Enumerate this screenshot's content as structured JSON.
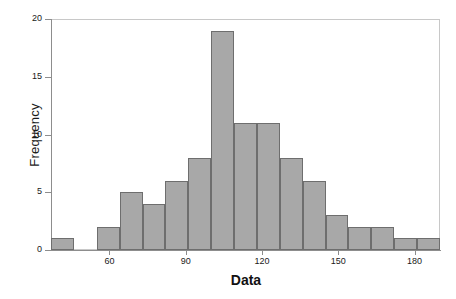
{
  "chart_data": {
    "type": "bar",
    "title": "",
    "xlabel": "Data",
    "ylabel": "Frequency",
    "xlim": [
      37,
      190
    ],
    "ylim": [
      0,
      20
    ],
    "grid": false,
    "legend": null,
    "bin_width": 9,
    "x_ticks": [
      60,
      90,
      120,
      150,
      180
    ],
    "y_ticks": [
      0,
      5,
      10,
      15,
      20
    ],
    "bar_color": "#a8a8a8",
    "bar_edge_color": "#6e6e6e",
    "categories": [
      "37-46",
      "46-55",
      "55-64",
      "64-73",
      "73-82",
      "82-91",
      "91-100",
      "100-109",
      "109-118",
      "118-127",
      "127-136",
      "136-145",
      "145-154",
      "154-163",
      "163-172",
      "172-181",
      "181-190"
    ],
    "bin_starts": [
      37,
      46,
      55,
      64,
      73,
      82,
      91,
      100,
      109,
      118,
      127,
      136,
      145,
      154,
      163,
      172,
      181
    ],
    "values": [
      1,
      0,
      2,
      5,
      4,
      6,
      8,
      19,
      11,
      11,
      8,
      6,
      3,
      2,
      2,
      1,
      1
    ],
    "total_count": 90
  },
  "axes": {
    "y_tick_labels": [
      "0",
      "5",
      "10",
      "15",
      "20"
    ],
    "x_tick_labels": [
      "60",
      "90",
      "120",
      "150",
      "180"
    ],
    "x_axis_title": "Data",
    "y_axis_title": "Frequency"
  }
}
